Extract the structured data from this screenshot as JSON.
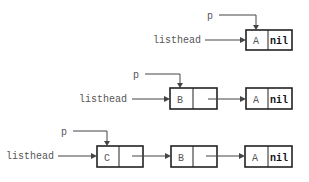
{
  "diagram": {
    "type": "linked-list-insertion",
    "colors": {
      "line": "#444444",
      "box": "#222222",
      "text": "#555555",
      "nil": "#111111"
    },
    "rows": [
      {
        "pointer_label": "p",
        "head_label": "listhead",
        "nodes": [
          {
            "value": "A",
            "next": "nil"
          }
        ]
      },
      {
        "pointer_label": "p",
        "head_label": "listhead",
        "nodes": [
          {
            "value": "B",
            "next": ""
          },
          {
            "value": "A",
            "next": "nil"
          }
        ]
      },
      {
        "pointer_label": "p",
        "head_label": "listhead",
        "nodes": [
          {
            "value": "C",
            "next": ""
          },
          {
            "value": "B",
            "next": ""
          },
          {
            "value": "A",
            "next": "nil"
          }
        ]
      }
    ]
  }
}
